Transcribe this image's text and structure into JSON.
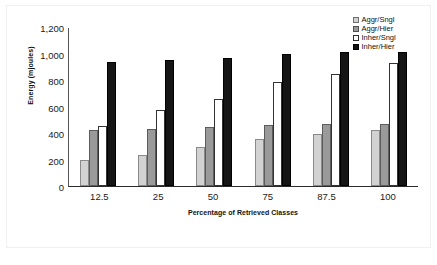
{
  "chart_data": {
    "type": "bar",
    "title": "",
    "xlabel": "Percentage of Retrieved Classes",
    "ylabel": "Energy (mjoules)",
    "categories": [
      "12.5",
      "25",
      "50",
      "75",
      "87.5",
      "100"
    ],
    "ylim": [
      0,
      1200
    ],
    "yticks": [
      1200,
      1000,
      800,
      600,
      400,
      200,
      0
    ],
    "ytick_labels": [
      "1,200",
      "1,000",
      "800",
      "600",
      "400",
      "200",
      "0"
    ],
    "grid": false,
    "legend_position": "top-right",
    "series": [
      {
        "name": "Aggr/Sngl",
        "color": "#d2d2d2",
        "values": [
          200,
          235,
          295,
          352,
          392,
          422
        ]
      },
      {
        "name": "Aggr/Hier",
        "color": "#9a9a9a",
        "values": [
          420,
          432,
          442,
          458,
          468,
          470
        ]
      },
      {
        "name": "Inher/Sngl",
        "color": "#ffffff",
        "values": [
          455,
          570,
          655,
          785,
          848,
          932
        ]
      },
      {
        "name": "Inher/Hier",
        "color": "#151515",
        "values": [
          935,
          950,
          965,
          995,
          1010,
          1015
        ]
      }
    ]
  }
}
